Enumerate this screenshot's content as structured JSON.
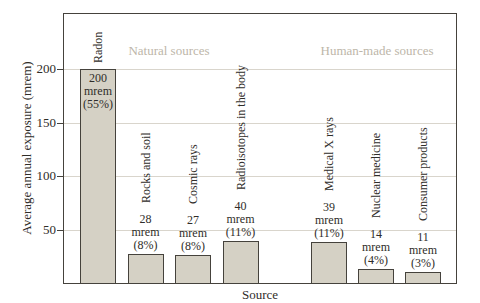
{
  "chart_data": {
    "type": "bar",
    "title": "",
    "xlabel": "Source",
    "ylabel": "Average annual exposure (mrem)",
    "ylim": [
      0,
      252
    ],
    "yticks": [
      50,
      100,
      150,
      200
    ],
    "grid": "horizontal",
    "legend_position": "none",
    "unit_label": "mrem",
    "categories": [
      "Radon",
      "Rocks and soil",
      "Cosmic rays",
      "Radioisotopes in the body",
      "Medical X rays",
      "Nuclear medicine",
      "Consumer products"
    ],
    "values": [
      200,
      28,
      27,
      40,
      39,
      14,
      11
    ],
    "percents": [
      "(55%)",
      "(8%)",
      "(8%)",
      "(11%)",
      "(11%)",
      "(4%)",
      "(3%)"
    ],
    "groups": [
      {
        "label": "Natural sources",
        "members": [
          "Radon",
          "Rocks and soil",
          "Cosmic rays",
          "Radioisotopes in the body"
        ]
      },
      {
        "label": "Human-made sources",
        "members": [
          "Medical X rays",
          "Nuclear medicine",
          "Consumer products"
        ]
      }
    ],
    "colors": {
      "bar_fill": "#d5d1c5",
      "bar_border": "#45423c",
      "grid_line": "#d9d5cc",
      "axis_border": "#45423c",
      "text": "#2f2d29",
      "group_label_text": "#bdb6a9",
      "background": "#ffffff"
    }
  }
}
